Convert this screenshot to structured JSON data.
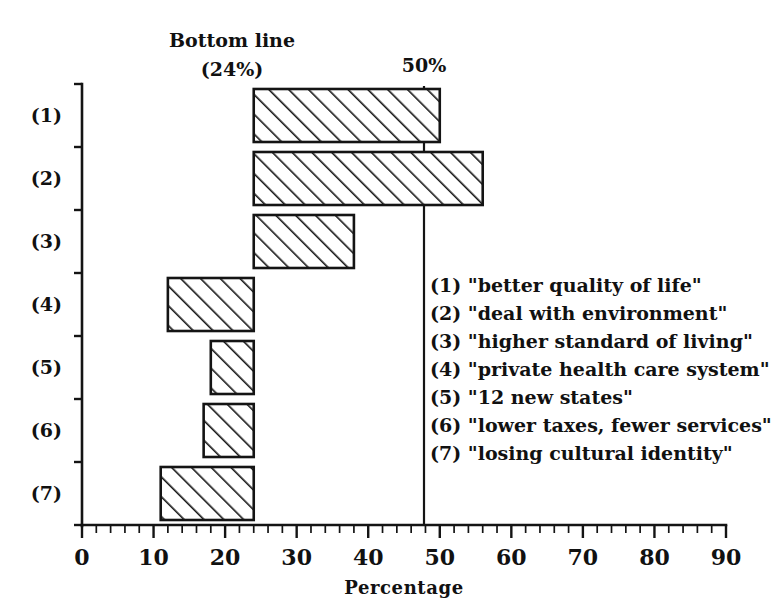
{
  "chart_data": {
    "type": "bar",
    "orientation": "horizontal",
    "title": "",
    "xlabel": "Percentage",
    "ylabel": "",
    "xlim": [
      0,
      90
    ],
    "xticks": [
      0,
      10,
      20,
      30,
      40,
      50,
      60,
      70,
      80,
      90
    ],
    "xtick_labels": [
      "0",
      "10",
      "20",
      "30",
      "40",
      "50",
      "60",
      "70",
      "80",
      "90"
    ],
    "minor_tick_step": 2,
    "grid": false,
    "legend_position": "inside-right",
    "baseline": 24,
    "baseline_label_line1": "Bottom line",
    "baseline_label_line2": "(24%)",
    "reference_line": 50,
    "reference_label": "50%",
    "categories": [
      "(1)",
      "(2)",
      "(3)",
      "(4)",
      "(5)",
      "(6)",
      "(7)"
    ],
    "values": [
      50,
      56,
      38,
      12,
      18,
      17,
      11
    ],
    "bars": [
      {
        "category": "(1)",
        "value": 50,
        "from": 24,
        "to": 50,
        "direction": "right"
      },
      {
        "category": "(2)",
        "value": 56,
        "from": 24,
        "to": 56,
        "direction": "right"
      },
      {
        "category": "(3)",
        "value": 38,
        "from": 24,
        "to": 38,
        "direction": "right"
      },
      {
        "category": "(4)",
        "value": 12,
        "from": 24,
        "to": 12,
        "direction": "left"
      },
      {
        "category": "(5)",
        "value": 18,
        "from": 24,
        "to": 18,
        "direction": "left"
      },
      {
        "category": "(6)",
        "value": 17,
        "from": 24,
        "to": 17,
        "direction": "left"
      },
      {
        "category": "(7)",
        "value": 11,
        "from": 24,
        "to": 11,
        "direction": "left"
      }
    ],
    "legend_entries": [
      "(1) \"better quality of life\"",
      "(2) \"deal with environment\"",
      "(3) \"higher standard of living\"",
      "(4) \"private health care system\"",
      "(5) \"12 new states\"",
      "(6) \"lower taxes, fewer services\"",
      "(7) \"losing cultural identity\""
    ],
    "colors": {
      "ink": "#141414",
      "paper": "#ffffff",
      "bar_fill": "#ffffff",
      "hatch": "#141414"
    }
  },
  "axis": {
    "x_tick_0": "0",
    "x_tick_1": "10",
    "x_tick_2": "20",
    "x_tick_3": "30",
    "x_tick_4": "40",
    "x_tick_5": "50",
    "x_tick_6": "60",
    "x_tick_7": "70",
    "x_tick_8": "80",
    "x_tick_9": "90",
    "x_title": "Percentage"
  },
  "annotations": {
    "bottom_line_1": "Bottom line",
    "bottom_line_2": "(24%)",
    "fifty_percent": "50%"
  },
  "category_labels": {
    "c1": "(1)",
    "c2": "(2)",
    "c3": "(3)",
    "c4": "(4)",
    "c5": "(5)",
    "c6": "(6)",
    "c7": "(7)"
  },
  "legend": {
    "l1": "(1) \"better quality of life\"",
    "l2": "(2) \"deal with environment\"",
    "l3": "(3) \"higher standard of living\"",
    "l4": "(4) \"private health care system\"",
    "l5": "(5) \"12 new states\"",
    "l6": "(6) \"lower taxes, fewer services\"",
    "l7": "(7) \"losing cultural identity\""
  }
}
